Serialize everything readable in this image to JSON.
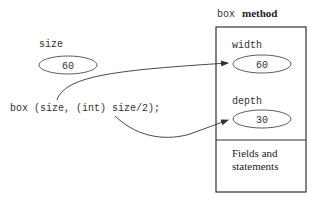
{
  "method_block": {
    "title_code": "box",
    "title_word": "method",
    "params": [
      {
        "name": "width",
        "value": "60"
      },
      {
        "name": "depth",
        "value": "30"
      }
    ],
    "body_label_line1": "Fields and",
    "body_label_line2": "statements"
  },
  "caller": {
    "variable": {
      "name": "size",
      "value": "60"
    },
    "call_statement": "box (size, (int) size/2);"
  },
  "arrows": [
    {
      "from": "size",
      "to": "width"
    },
    {
      "from": "(int) size/2",
      "to": "depth"
    }
  ],
  "colors": {
    "stroke": "#333333",
    "text": "#333333",
    "background": "#ffffff"
  }
}
